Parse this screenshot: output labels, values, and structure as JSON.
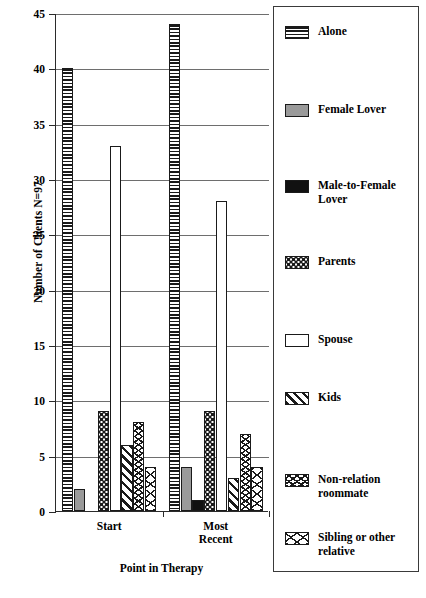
{
  "chart_data": {
    "type": "bar",
    "title": "",
    "xlabel": "Point in Therapy",
    "ylabel": "Number of Clients N=97",
    "categories": [
      "Start",
      "Most Recent"
    ],
    "ylim": [
      0,
      45
    ],
    "yticks": [
      0,
      5,
      10,
      15,
      20,
      25,
      30,
      35,
      40,
      45
    ],
    "grid": true,
    "legend_position": "right",
    "series": [
      {
        "name": "Alone",
        "pattern": "horizontal-lines",
        "values": [
          40,
          44
        ]
      },
      {
        "name": "Female Lover",
        "pattern": "solid-gray",
        "values": [
          2,
          4
        ]
      },
      {
        "name": "Male-to-Female Lover",
        "pattern": "solid-black",
        "values": [
          0,
          1
        ]
      },
      {
        "name": "Parents",
        "pattern": "dots",
        "values": [
          9,
          9
        ]
      },
      {
        "name": "Spouse",
        "pattern": "solid-white",
        "values": [
          33,
          28
        ]
      },
      {
        "name": "Kids",
        "pattern": "diagonal-hatch",
        "values": [
          6,
          3
        ]
      },
      {
        "name": "Non-relation roommate",
        "pattern": "zigzag",
        "values": [
          8,
          7
        ]
      },
      {
        "name": "Sibling or other relative",
        "pattern": "sparse-zigzag",
        "values": [
          4,
          4
        ]
      }
    ]
  },
  "axis": {
    "y_title": "Number of Clients N=97",
    "x_title": "Point in Therapy",
    "y_tick_labels": [
      "0",
      "5",
      "10",
      "15",
      "20",
      "25",
      "30",
      "35",
      "40",
      "45"
    ],
    "x_tick_labels": [
      "Start",
      "Most\nRecent"
    ]
  },
  "legend": {
    "items": [
      {
        "label": "Alone"
      },
      {
        "label": "Female Lover"
      },
      {
        "label": "Male-to-Female\nLover"
      },
      {
        "label": "Parents"
      },
      {
        "label": "Spouse"
      },
      {
        "label": "Kids"
      },
      {
        "label": "Non-relation\nroommate"
      },
      {
        "label": "Sibling or other\nrelative"
      }
    ]
  },
  "colors": {
    "ink": "#1a1a1a",
    "gray_fill": "#9a9a9a",
    "black_fill": "#111111",
    "gridline": "#6e6e6e",
    "background": "#ffffff"
  }
}
